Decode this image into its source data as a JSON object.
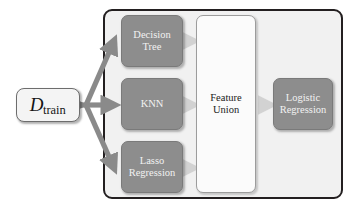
{
  "diagram": {
    "colors": {
      "container_fill": "#f1f1f1",
      "container_border": "#231f20",
      "estimator_fill": "#8d8d8d",
      "estimator_text": "#f2f2f2",
      "feature_union_fill": "#fbfbfb",
      "dataset_fill": "#f4f4f4",
      "thick_arrow": "#8a8a8a",
      "thin_arrow": "#d2d2d2"
    },
    "dataset": {
      "symbol": "D",
      "subscript": "train",
      "name": "D_train"
    },
    "base_estimators": [
      {
        "label": "Decision\nTree",
        "name": "decision-tree"
      },
      {
        "label": "KNN",
        "name": "knn"
      },
      {
        "label": "Lasso\nRegression",
        "name": "lasso-regression"
      }
    ],
    "combiner": {
      "label": "Feature\nUnion",
      "name": "feature-union"
    },
    "final_estimator": {
      "label": "Logistic\nRegression",
      "name": "logistic-regression"
    },
    "edges": [
      {
        "from": "D_train",
        "to": "Decision Tree"
      },
      {
        "from": "D_train",
        "to": "KNN"
      },
      {
        "from": "D_train",
        "to": "Lasso Regression"
      },
      {
        "from": "Decision Tree",
        "to": "Feature Union"
      },
      {
        "from": "KNN",
        "to": "Feature Union"
      },
      {
        "from": "Lasso Regression",
        "to": "Feature Union"
      },
      {
        "from": "Feature Union",
        "to": "Logistic Regression"
      }
    ]
  }
}
